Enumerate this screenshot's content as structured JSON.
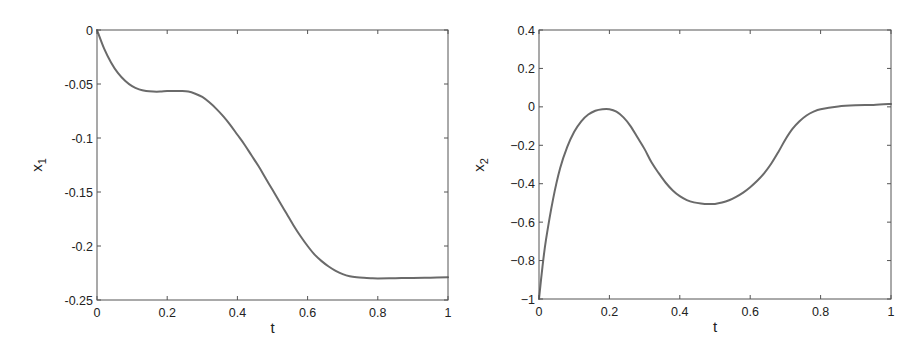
{
  "chart_data": [
    {
      "type": "line",
      "title": "",
      "xlabel": "t",
      "ylabel": "x_1",
      "ylabel_main": "x",
      "ylabel_sub": "1",
      "xlim": [
        0,
        1
      ],
      "ylim": [
        -0.25,
        0
      ],
      "grid": false,
      "xticks": [
        0,
        0.2,
        0.4,
        0.6,
        0.8,
        1
      ],
      "xtick_labels": [
        "0",
        "0.2",
        "0.4",
        "0.6",
        "0.8",
        "1"
      ],
      "yticks": [
        0,
        -0.05,
        -0.1,
        -0.15,
        -0.2,
        -0.25
      ],
      "ytick_labels": [
        "0",
        "-0.05",
        "-0.1",
        "-0.15",
        "-0.2",
        "-0.25"
      ],
      "series": [
        {
          "name": "x1",
          "x": [
            0,
            0.02,
            0.04,
            0.06,
            0.08,
            0.1,
            0.12,
            0.14,
            0.16,
            0.18,
            0.2,
            0.22,
            0.24,
            0.26,
            0.28,
            0.3,
            0.32,
            0.34,
            0.36,
            0.38,
            0.4,
            0.42,
            0.44,
            0.46,
            0.48,
            0.5,
            0.52,
            0.54,
            0.56,
            0.58,
            0.6,
            0.62,
            0.64,
            0.66,
            0.68,
            0.7,
            0.72,
            0.74,
            0.76,
            0.78,
            0.8,
            0.85,
            0.9,
            0.95,
            1.0
          ],
          "values": [
            0,
            -0.017,
            -0.03,
            -0.04,
            -0.047,
            -0.052,
            -0.055,
            -0.0565,
            -0.057,
            -0.057,
            -0.0565,
            -0.0565,
            -0.0565,
            -0.057,
            -0.059,
            -0.062,
            -0.067,
            -0.073,
            -0.08,
            -0.088,
            -0.097,
            -0.106,
            -0.116,
            -0.126,
            -0.137,
            -0.148,
            -0.159,
            -0.17,
            -0.181,
            -0.191,
            -0.2,
            -0.208,
            -0.214,
            -0.219,
            -0.223,
            -0.226,
            -0.228,
            -0.229,
            -0.2295,
            -0.2298,
            -0.23,
            -0.2298,
            -0.2296,
            -0.2293,
            -0.229
          ],
          "color": "#6a6a6a"
        }
      ]
    },
    {
      "type": "line",
      "title": "",
      "xlabel": "t",
      "ylabel": "x_2",
      "ylabel_main": "x",
      "ylabel_sub": "2",
      "xlim": [
        0,
        1
      ],
      "ylim": [
        -1,
        0.4
      ],
      "grid": false,
      "xticks": [
        0,
        0.2,
        0.4,
        0.6,
        0.8,
        1
      ],
      "xtick_labels": [
        "0",
        "0.2",
        "0.4",
        "0.6",
        "0.8",
        "1"
      ],
      "yticks": [
        0.4,
        0.2,
        0,
        -0.2,
        -0.4,
        -0.6,
        -0.8,
        -1
      ],
      "ytick_labels": [
        "0.4",
        "0.2",
        "0",
        "−0.2",
        "−0.4",
        "−0.6",
        "−0.8",
        "−1"
      ],
      "series": [
        {
          "name": "x2",
          "x": [
            0,
            0.01,
            0.02,
            0.04,
            0.06,
            0.08,
            0.1,
            0.12,
            0.14,
            0.16,
            0.18,
            0.2,
            0.22,
            0.24,
            0.26,
            0.28,
            0.3,
            0.32,
            0.34,
            0.36,
            0.38,
            0.4,
            0.42,
            0.44,
            0.46,
            0.48,
            0.5,
            0.52,
            0.54,
            0.56,
            0.58,
            0.6,
            0.62,
            0.64,
            0.66,
            0.68,
            0.7,
            0.72,
            0.74,
            0.76,
            0.78,
            0.8,
            0.85,
            0.9,
            0.95,
            1.0
          ],
          "values": [
            -1.0,
            -0.83,
            -0.69,
            -0.48,
            -0.32,
            -0.21,
            -0.13,
            -0.075,
            -0.04,
            -0.02,
            -0.012,
            -0.012,
            -0.025,
            -0.055,
            -0.1,
            -0.16,
            -0.22,
            -0.29,
            -0.345,
            -0.395,
            -0.435,
            -0.465,
            -0.485,
            -0.497,
            -0.503,
            -0.506,
            -0.505,
            -0.498,
            -0.486,
            -0.468,
            -0.446,
            -0.418,
            -0.385,
            -0.345,
            -0.295,
            -0.235,
            -0.17,
            -0.115,
            -0.075,
            -0.045,
            -0.025,
            -0.012,
            0.002,
            0.008,
            0.01,
            0.015
          ],
          "color": "#6a6a6a"
        }
      ]
    }
  ]
}
